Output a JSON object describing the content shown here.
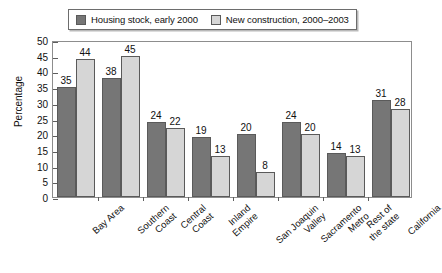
{
  "chart_data": {
    "type": "bar",
    "title": "",
    "subtitle": "",
    "xlabel": "",
    "ylabel": "Percentage",
    "ylim": [
      0,
      50
    ],
    "ytick_step": 5,
    "yticks": [
      "0",
      "5",
      "10",
      "15",
      "20",
      "25",
      "30",
      "35",
      "40",
      "45",
      "50"
    ],
    "grid": false,
    "legend_position": "top",
    "categories": [
      "Bay Area",
      "Southern Coast",
      "Central Coast",
      "Inland Empire",
      "San Joaquin Valley",
      "Sacramento Metro",
      "Rest of the state",
      "California"
    ],
    "category_lines": [
      [
        "Bay Area",
        ""
      ],
      [
        "Southern",
        "Coast"
      ],
      [
        "Central",
        "Coast"
      ],
      [
        "Inland",
        "Empire"
      ],
      [
        "San Joaquin",
        "Valley"
      ],
      [
        "Sacramento",
        "Metro"
      ],
      [
        "Rest of",
        "the state"
      ],
      [
        "California",
        ""
      ]
    ],
    "series": [
      {
        "name": "Housing stock, early 2000",
        "color": "#767676",
        "values": [
          35,
          38,
          24,
          19,
          20,
          24,
          14,
          31
        ]
      },
      {
        "name": "New construction, 2000-2003",
        "color": "#d6d6d6",
        "values": [
          44,
          45,
          22,
          13,
          8,
          20,
          13,
          28
        ]
      }
    ],
    "data_labels": {
      "housing_stock": [
        "35",
        "38",
        "24",
        "19",
        "20",
        "24",
        "14",
        "31"
      ],
      "new_construction": [
        "44",
        "45",
        "22",
        "13",
        "8",
        "20",
        "13",
        "28"
      ]
    }
  },
  "legend": {
    "entries": [
      {
        "label": "Housing stock, early 2000",
        "swatch": "dark"
      },
      {
        "label": "New construction, 2000–2003",
        "swatch": "light"
      }
    ]
  },
  "axis": {
    "y_title": "Percentage"
  },
  "colors": {
    "series_dark": "#767676",
    "series_light": "#d6d6d6",
    "frame": "#8d8d8d",
    "text": "#111111"
  }
}
